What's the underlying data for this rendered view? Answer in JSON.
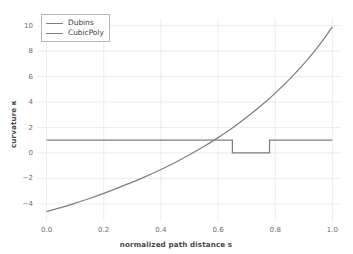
{
  "chart_data": {
    "type": "line",
    "title": "",
    "xlabel": "normalized path distance s",
    "ylabel": "curvature κ",
    "xlim": [
      -0.03,
      1.03
    ],
    "ylim": [
      -5.35,
      10.6
    ],
    "xticks": [
      "0.0",
      "0.2",
      "0.4",
      "0.6",
      "0.8",
      "1.0"
    ],
    "xtick_values": [
      0.0,
      0.2,
      0.4,
      0.6,
      0.8,
      1.0
    ],
    "yticks": [
      "10",
      "8",
      "6",
      "4",
      "2",
      "0",
      "−2",
      "−4"
    ],
    "ytick_values": [
      10,
      8,
      6,
      4,
      2,
      0,
      -2,
      -4
    ],
    "grid": true,
    "grid_color": "#e8e8e8",
    "legend_position": "upper left",
    "series": [
      {
        "name": "Dubins",
        "color": "#7f7f7f",
        "style": "step",
        "x": [
          0.0,
          0.65,
          0.65,
          0.78,
          0.78,
          1.0
        ],
        "values": [
          1.0,
          1.0,
          0.0,
          0.0,
          1.0,
          1.0
        ]
      },
      {
        "name": "CubicPoly",
        "color": "#7f7f7f",
        "style": "smooth",
        "x": [
          0.0,
          0.05,
          0.1,
          0.15,
          0.2,
          0.25,
          0.3,
          0.35,
          0.4,
          0.45,
          0.5,
          0.55,
          0.6,
          0.65,
          0.7,
          0.75,
          0.8,
          0.85,
          0.9,
          0.95,
          1.0
        ],
        "values": [
          -4.6,
          -4.3,
          -3.95,
          -3.58,
          -3.18,
          -2.75,
          -2.3,
          -1.82,
          -1.3,
          -0.75,
          -0.15,
          0.5,
          1.2,
          1.95,
          2.8,
          3.7,
          4.7,
          5.8,
          7.0,
          8.35,
          9.9
        ]
      }
    ]
  },
  "legend": {
    "entries": [
      {
        "label": "Dubins"
      },
      {
        "label": "CubicPoly"
      }
    ]
  },
  "colors": {
    "line": "#7f7f7f",
    "grid": "#e8e8e8",
    "tick_text": "#6b6b6b",
    "background": "#ffffff"
  }
}
